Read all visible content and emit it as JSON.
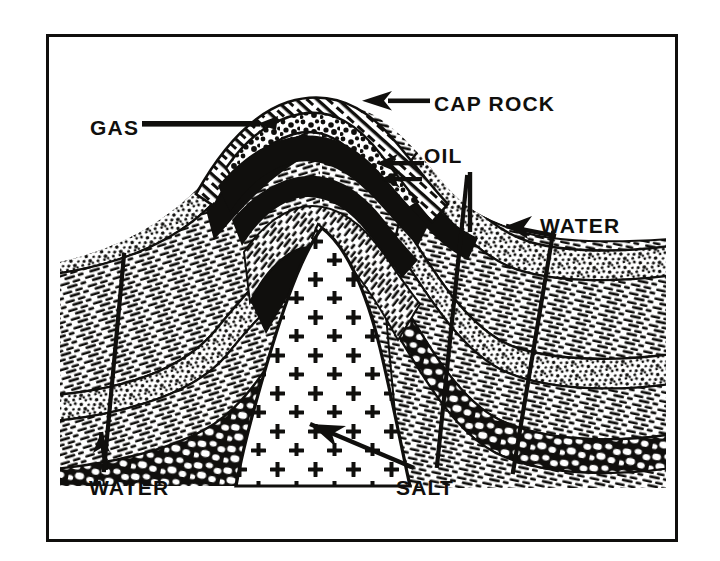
{
  "figure": {
    "kind": "geological-cross-section",
    "frame_color": "#100f0d",
    "background_color": "#ffffff",
    "ink_color": "#100f0d"
  },
  "labels": {
    "cap_rock": "CAP ROCK",
    "gas": "GAS",
    "oil": "OIL",
    "water_right": "WATER",
    "water_left": "WATER",
    "salt": "SALT"
  },
  "leaders": {
    "cap_rock": "arrow-pointing-left",
    "gas": "line-pointing-right",
    "oil": "arrow-pointing-left",
    "water_right": "arrow-pointing-left-down",
    "water_left": "line-pointing-up",
    "salt": "arrow-pointing-up-left"
  },
  "legend_units": [
    {
      "name": "cap-rock",
      "pattern": "stipple-sand",
      "fill": "#ffffff",
      "ink": "#100f0d"
    },
    {
      "name": "gas-zone",
      "pattern": "coarse-stipple",
      "fill": "#ffffff",
      "ink": "#100f0d"
    },
    {
      "name": "oil-zone",
      "pattern": "solid-black",
      "fill": "#100f0d",
      "ink": "#100f0d"
    },
    {
      "name": "shale",
      "pattern": "dash-hatch",
      "fill": "#ffffff",
      "ink": "#100f0d"
    },
    {
      "name": "sandstone",
      "pattern": "stipple",
      "fill": "#ffffff",
      "ink": "#100f0d"
    },
    {
      "name": "conglomerate",
      "pattern": "pebble",
      "fill": "#ffffff",
      "ink": "#100f0d"
    },
    {
      "name": "salt-core",
      "pattern": "plus-crosses",
      "fill": "#ffffff",
      "ink": "#100f0d"
    }
  ],
  "wells": [
    {
      "name": "well-left",
      "x_top": 124,
      "x_bottom": 104
    },
    {
      "name": "well-center-right",
      "x_top": 467,
      "x_bottom": 437
    },
    {
      "name": "well-right",
      "x_top": 553,
      "x_bottom": 513
    }
  ]
}
